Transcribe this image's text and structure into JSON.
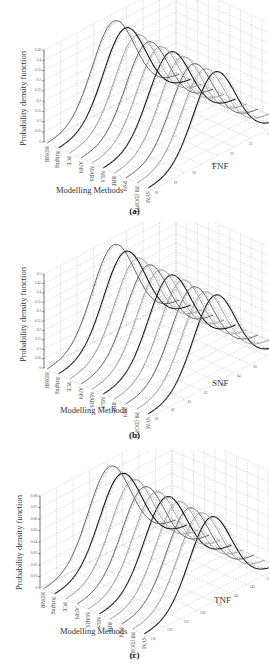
{
  "figure": {
    "panels": [
      {
        "id": "a",
        "caption": "(a)",
        "ylabel": "Probability density function",
        "xlabel": "Modelling Methods",
        "zlabel": "FNF"
      },
      {
        "id": "b",
        "caption": "(b)",
        "ylabel": "Probability density function",
        "xlabel": "Modelling Methods",
        "zlabel": "SNF"
      },
      {
        "id": "c",
        "caption": "(c)",
        "ylabel": "Probability density function",
        "xlabel": "Modelling Methods",
        "zlabel": "TNF"
      }
    ],
    "methods": [
      "HDMR",
      "Kriging",
      "PCE",
      "ANN",
      "MARS",
      "MLS",
      "RBF",
      "PSN",
      "PR (DOPT)",
      "SVM"
    ],
    "colors": {
      "dark_curve": "#1a1a1a",
      "mid_curve": "#555555",
      "light_curve": "#9a9a9a",
      "grid": "#bdbdbd",
      "axis": "#333333"
    }
  },
  "chart_data": [
    {
      "type": "line",
      "subtype": "3d-waterfall",
      "title": "(a)",
      "xlabel": "Modelling Methods",
      "ylabel": "Probability density function",
      "zlabel": "FNF",
      "categories": [
        "HDMR",
        "Kriging",
        "PCE",
        "ANN",
        "MARS",
        "MLS",
        "RBF",
        "PSN",
        "PR (DOPT)",
        "SVM"
      ],
      "y_ticks": [
        "0",
        "0.05",
        "0.1",
        "0.15",
        "0.2",
        "0.25",
        "0.3",
        "0.35",
        "0.4",
        "0.45"
      ],
      "z_ticks": [
        "18",
        "19",
        "20",
        "21",
        "22",
        "23",
        "24",
        "25"
      ],
      "ylim": [
        0,
        0.45
      ],
      "grid": true,
      "series_peaks": [
        0.43,
        0.42,
        0.41,
        0.4,
        0.4,
        0.4,
        0.4,
        0.39,
        0.39,
        0.4
      ]
    },
    {
      "type": "line",
      "subtype": "3d-waterfall",
      "title": "(b)",
      "xlabel": "Modelling Methods",
      "ylabel": "Probability density function",
      "zlabel": "SNF",
      "categories": [
        "HDMR",
        "Kriging",
        "PCE",
        "ANN",
        "MARS",
        "MLS",
        "RBF",
        "PSN",
        "PR (DOPT)",
        "SVM"
      ],
      "y_ticks": [
        "0",
        "0.05",
        "0.1",
        "0.15",
        "0.2",
        "0.25",
        "0.3",
        "0.35",
        "0.4",
        "0.45",
        "0.5"
      ],
      "z_ticks": [
        "58",
        "60",
        "61",
        "62",
        "63",
        "64",
        "65",
        "66",
        "67"
      ],
      "ylim": [
        0,
        0.5
      ],
      "grid": true,
      "series_peaks": [
        0.48,
        0.47,
        0.46,
        0.45,
        0.45,
        0.45,
        0.45,
        0.44,
        0.44,
        0.45
      ]
    },
    {
      "type": "line",
      "subtype": "3d-waterfall",
      "title": "(c)",
      "xlabel": "Modelling Methods",
      "ylabel": "Probability density function",
      "zlabel": "TNF",
      "categories": [
        "HDMR",
        "Kriging",
        "PCE",
        "ANN",
        "MARS",
        "MLS",
        "RBF",
        "PSN",
        "PR (DOPT)",
        "SVM"
      ],
      "y_ticks": [
        "0",
        "0.01",
        "0.02",
        "0.03",
        "0.04",
        "0.05",
        "0.06",
        "0.07",
        "0.08"
      ],
      "z_ticks": [
        "110",
        "120",
        "125",
        "130",
        "135",
        "140",
        "145",
        "150",
        "160"
      ],
      "ylim": [
        0,
        0.08
      ],
      "grid": true,
      "series_peaks": [
        0.077,
        0.075,
        0.074,
        0.072,
        0.072,
        0.072,
        0.072,
        0.071,
        0.071,
        0.072
      ]
    }
  ]
}
